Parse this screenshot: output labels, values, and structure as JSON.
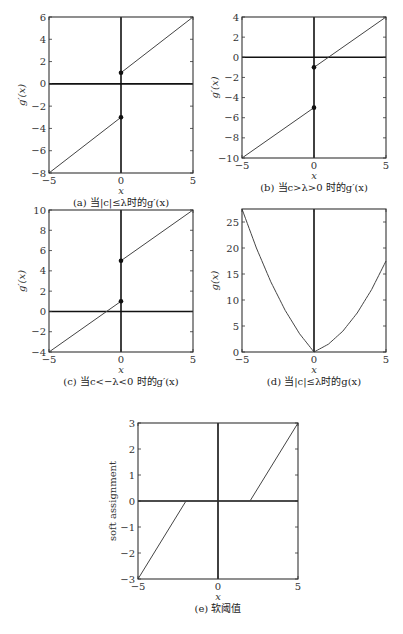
{
  "chart_data": [
    {
      "id": "a",
      "type": "line",
      "caption": "(a) 当|c|≤λ时的g′(x)",
      "xlabel": "x",
      "ylabel": "g′(x)",
      "xlim": [
        -5,
        5
      ],
      "ylim": [
        -8,
        6
      ],
      "xticks": [
        -5,
        0,
        5
      ],
      "yticks": [
        -8,
        -6,
        -4,
        -2,
        0,
        2,
        4,
        6
      ],
      "box": [
        49,
        17,
        193,
        173
      ],
      "series": [
        {
          "name": "left branch",
          "x": [
            -5,
            0
          ],
          "y": [
            -8,
            -3
          ]
        },
        {
          "name": "right branch",
          "x": [
            0,
            5
          ],
          "y": [
            1,
            6
          ]
        }
      ],
      "points": [
        [
          0,
          1
        ],
        [
          0,
          -3
        ]
      ],
      "zero_lines": true
    },
    {
      "id": "b",
      "type": "line",
      "caption": "(b) 当c>λ>0 时的g′(x)",
      "xlabel": "x",
      "ylabel": "g′(x)",
      "xlim": [
        -5,
        5
      ],
      "ylim": [
        -10,
        4
      ],
      "xticks": [
        -5,
        0,
        5
      ],
      "yticks": [
        -10,
        -8,
        -6,
        -4,
        -2,
        0,
        2,
        4
      ],
      "box": [
        242,
        17,
        386,
        158
      ],
      "series": [
        {
          "name": "left branch",
          "x": [
            -5,
            0
          ],
          "y": [
            -10,
            -5
          ]
        },
        {
          "name": "right branch",
          "x": [
            0,
            5
          ],
          "y": [
            -1,
            4
          ]
        }
      ],
      "points": [
        [
          0,
          -1
        ],
        [
          0,
          -5
        ]
      ],
      "zero_lines": true
    },
    {
      "id": "c",
      "type": "line",
      "caption": "(c) 当c<−λ<0 时的g′(x)",
      "xlabel": "x",
      "ylabel": "g′(x)",
      "xlim": [
        -5,
        5
      ],
      "ylim": [
        -4,
        10
      ],
      "xticks": [
        -5,
        0,
        5
      ],
      "yticks": [
        -4,
        -2,
        0,
        2,
        4,
        6,
        8,
        10
      ],
      "box": [
        49,
        210,
        193,
        352
      ],
      "series": [
        {
          "name": "left branch",
          "x": [
            -5,
            0
          ],
          "y": [
            -4,
            1
          ]
        },
        {
          "name": "right branch",
          "x": [
            0,
            5
          ],
          "y": [
            5,
            10
          ]
        }
      ],
      "points": [
        [
          0,
          5
        ],
        [
          0,
          1
        ]
      ],
      "zero_lines": true
    },
    {
      "id": "d",
      "type": "line",
      "caption": "(d) 当|c|≤λ时的g(x)",
      "xlabel": "x",
      "ylabel": "g(x)",
      "xlim": [
        -5,
        5
      ],
      "ylim": [
        0,
        27.5
      ],
      "xticks": [
        -5,
        0,
        5
      ],
      "yticks": [
        0,
        5,
        10,
        15,
        20,
        25
      ],
      "box": [
        242,
        209,
        386,
        352
      ],
      "series": [
        {
          "name": "left parabola",
          "x": [
            -5,
            -4,
            -3,
            -2,
            -1,
            0
          ],
          "y": [
            27.5,
            20,
            13.5,
            8,
            3.5,
            0
          ]
        },
        {
          "name": "right parabola",
          "x": [
            0,
            1,
            2,
            3,
            4,
            5
          ],
          "y": [
            0,
            1.5,
            4,
            7.5,
            12,
            17.5
          ]
        }
      ],
      "points": [],
      "zero_lines": "x-only"
    },
    {
      "id": "e",
      "type": "line",
      "caption": "(e) 软阈值",
      "xlabel": "x",
      "ylabel": "soft assignment",
      "xlim": [
        -5,
        5
      ],
      "ylim": [
        -3,
        3
      ],
      "xticks": [
        -5,
        0,
        5
      ],
      "yticks": [
        -3,
        -2,
        -1,
        0,
        1,
        2,
        3
      ],
      "box": [
        138,
        423,
        298,
        579
      ],
      "series": [
        {
          "name": "soft threshold",
          "x": [
            -5,
            -2,
            2,
            5
          ],
          "y": [
            -3,
            0,
            0,
            3
          ]
        }
      ],
      "points": [],
      "zero_lines": true
    }
  ]
}
